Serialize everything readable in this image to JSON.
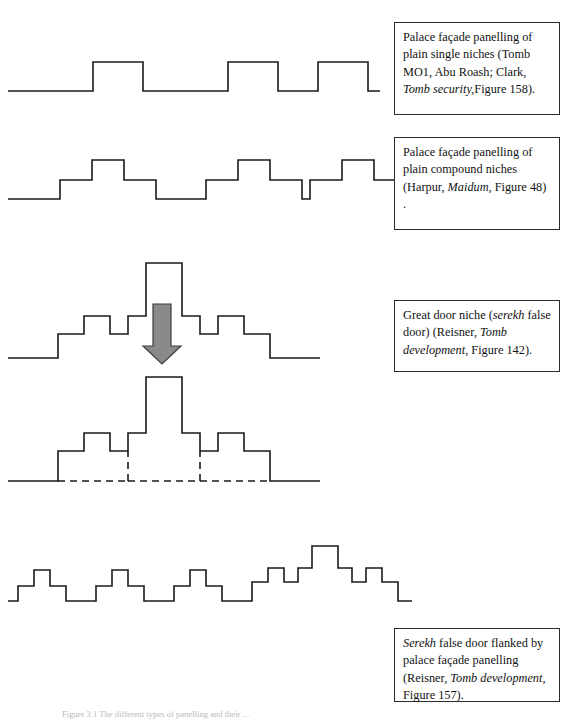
{
  "page": {
    "width": 570,
    "height": 721,
    "background": "#ffffff",
    "ink_color": "#1a1a1a",
    "arrow_color": "#8a8a8a"
  },
  "captions": {
    "single_niches": {
      "line1": "Palace façade panelling of",
      "line2": "plain single niches (Tomb",
      "line3": "MO1, Abu Roash; Clark,",
      "line4_italic": "Tomb security,",
      "line4_rest": "Figure 158)."
    },
    "compound_niches": {
      "line1": "Palace façade panelling of",
      "line2": "plain compound niches",
      "line3_pre": "(Harpur, ",
      "line3_italic": "Maidum,",
      "line3_post": " Figure",
      "line4": "48) ."
    },
    "great_door": {
      "line1_pre": "Great door niche (",
      "line1_italic": "serekh",
      "line2_pre": "false door) (Reisner, ",
      "line2_italic": "Tomb",
      "line3_italic": "development,",
      "line3_post": " Figure 142)."
    },
    "serekh_flanked": {
      "line1_italic": "Serekh",
      "line1_post": " false door flanked",
      "line2": "by palace façade panelling",
      "line3_pre": "(Reisner, ",
      "line3_italic": "Tomb",
      "line4_italic": "development,",
      "line4_post": " Figure 157)."
    }
  },
  "figure_caption": {
    "text": "Figure 3.1 The different types of panelling and their ..."
  },
  "diagrams": {
    "single_niches": {
      "label": "palace-facade-plain-single-niches",
      "description": "Square-wave profile with three plain raised niches on a baseline",
      "niche_count": 3,
      "step_levels": 1
    },
    "compound_niches": {
      "label": "palace-facade-plain-compound-niches",
      "description": "Stepped profile with three compound niches, each two steps high",
      "niche_count": 3,
      "step_levels": 2
    },
    "great_door": {
      "label": "great-door-niche-serekh-false-door",
      "description": "Symmetric stepped serekh profile with tall central doorway tower",
      "niche_count": 1,
      "step_levels": 3,
      "arrow": {
        "name": "down-arrow",
        "direction": "down",
        "color": "#8a8a8a"
      }
    },
    "great_door_recessed": {
      "label": "great-door-niche-recessed-outline",
      "description": "Same serekh profile drawn with dashed baseline showing recessed plan",
      "dashed_baseline": true
    },
    "serekh_flanked": {
      "label": "serekh-false-door-flanked-by-panelling",
      "description": "Three compound niches at left followed by a tall central serekh false door with flanking steps",
      "left_niche_count": 3,
      "step_levels": 3
    }
  }
}
